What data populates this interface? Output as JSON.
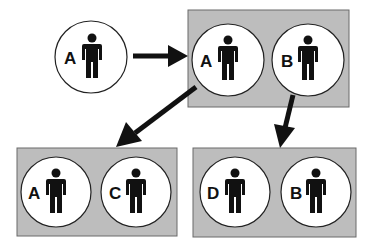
{
  "diagram": {
    "colors": {
      "box_fill": "#bdbdbd",
      "box_stroke": "#6a6a6a",
      "circle_fill": "#ffffff",
      "ink": "#111111"
    },
    "nodes": [
      {
        "id": "single-a",
        "label": "A"
      },
      {
        "id": "pair-top-a",
        "label": "A"
      },
      {
        "id": "pair-top-b",
        "label": "B"
      },
      {
        "id": "pair-left-a",
        "label": "A"
      },
      {
        "id": "pair-left-c",
        "label": "C"
      },
      {
        "id": "pair-right-d",
        "label": "D"
      },
      {
        "id": "pair-right-b",
        "label": "B"
      }
    ],
    "groups": [
      {
        "id": "top-pair",
        "members": [
          "A",
          "B"
        ]
      },
      {
        "id": "bottom-left-pair",
        "members": [
          "A",
          "C"
        ]
      },
      {
        "id": "bottom-right-pair",
        "members": [
          "D",
          "B"
        ]
      }
    ],
    "edges": [
      {
        "from": "single-a",
        "to": "top-pair"
      },
      {
        "from": "top-pair",
        "to": "bottom-left-pair"
      },
      {
        "from": "top-pair",
        "to": "bottom-right-pair"
      }
    ]
  }
}
